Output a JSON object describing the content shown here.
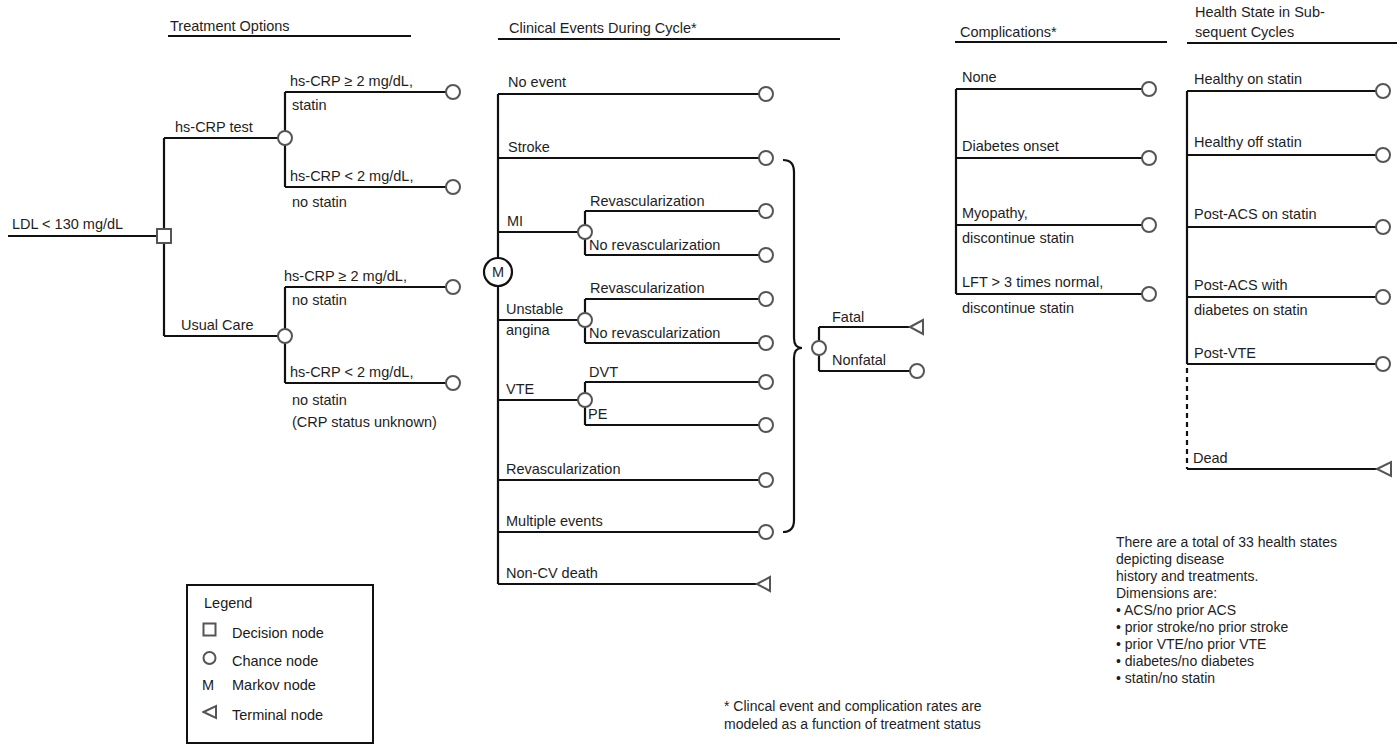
{
  "headers": {
    "treatment": "Treatment Options",
    "clinical": "Clinical Events During Cycle*",
    "complications": "Complications*",
    "health_state_line1": "Health State in Sub-",
    "health_state_line2": "sequent Cycles"
  },
  "root": {
    "label": "LDL < 130 mg/dL",
    "node": "decision-node"
  },
  "treatment": {
    "hs_crp_test": {
      "label": "hs-CRP test",
      "branches": [
        {
          "line1": "hs-CRP ≥ 2 mg/dL,",
          "line2": "statin"
        },
        {
          "line1": "hs-CRP < 2 mg/dL,",
          "line2": "no statin"
        }
      ]
    },
    "usual_care": {
      "label": "Usual Care",
      "branches": [
        {
          "line1": "hs-CRP ≥ 2 mg/dL,",
          "line2": "no statin"
        },
        {
          "line1": "hs-CRP < 2 mg/dL,",
          "line2": "no statin",
          "line3": "(CRP status unknown)"
        }
      ]
    }
  },
  "markov_node": {
    "label": "M"
  },
  "clinical_events": {
    "no_event": "No event",
    "stroke": "Stroke",
    "mi": {
      "label": "MI",
      "branches": [
        "Revascularization",
        "No revascularization"
      ]
    },
    "unstable_angina": {
      "line1": "Unstable",
      "line2": "angina",
      "branches": [
        "Revascularization",
        "No revascularization"
      ]
    },
    "vte": {
      "label": "VTE",
      "branches": [
        "DVT",
        "PE"
      ]
    },
    "revascularization": "Revascularization",
    "multiple_events": "Multiple events",
    "non_cv_death": "Non-CV death"
  },
  "outcome": {
    "fatal": "Fatal",
    "nonfatal": "Nonfatal"
  },
  "complications": [
    {
      "line1": "None"
    },
    {
      "line1": "Diabetes onset"
    },
    {
      "line1": "Myopathy,",
      "line2": "discontinue statin"
    },
    {
      "line1": "LFT > 3 times normal,",
      "line2": "discontinue statin"
    }
  ],
  "health_states": [
    {
      "line1": "Healthy on statin"
    },
    {
      "line1": "Healthy off statin"
    },
    {
      "line1": "Post-ACS on statin"
    },
    {
      "line1": "Post-ACS with",
      "line2": "diabetes on statin"
    },
    {
      "line1": "Post-VTE"
    },
    {
      "line1": "Dead"
    }
  ],
  "legend": {
    "title": "Legend",
    "items": [
      {
        "symbol": "square",
        "label": "Decision node"
      },
      {
        "symbol": "circle",
        "label": "Chance node"
      },
      {
        "symbol": "M",
        "label": "Markov node"
      },
      {
        "symbol": "triangle",
        "label": "Terminal node"
      }
    ]
  },
  "footnote": {
    "line1": "* Clincal event and complication rates are",
    "line2": "modeled as a function of treatment status"
  },
  "health_state_note": {
    "lines": [
      "There are a total of 33 health states",
      "depicting disease",
      "history and treatments.",
      "Dimensions are:"
    ],
    "bullets": [
      "• ACS/no prior ACS",
      "• prior stroke/no prior stroke",
      "• prior VTE/no prior VTE",
      "• diabetes/no diabetes",
      "• statin/no statin"
    ]
  },
  "colors": {
    "line": "#111111",
    "node": "#555555",
    "background": "#ffffff"
  }
}
